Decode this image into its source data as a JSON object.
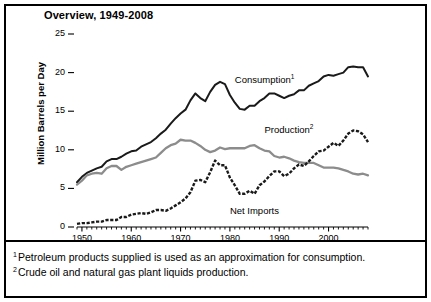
{
  "figure": {
    "title": "Overview, 1949-2008",
    "footnotes": [
      {
        "marker": "1",
        "text": "Petroleum products supplied is used as an approximation for consumption."
      },
      {
        "marker": "2",
        "text": "Crude oil and natural gas plant liquids production."
      }
    ]
  },
  "chart_data": {
    "type": "line",
    "title": "Overview, 1949-2008",
    "xlabel": "",
    "ylabel": "Million Barrels per Day",
    "xlim": [
      1949,
      2008
    ],
    "ylim": [
      0,
      25
    ],
    "yticks": [
      0,
      5,
      10,
      15,
      20,
      25
    ],
    "ytick_labels": [
      "0",
      "5",
      "10",
      "15",
      "20",
      "25"
    ],
    "xticks": [
      1950,
      1960,
      1970,
      1980,
      1990,
      2000
    ],
    "xtick_labels": [
      "1950",
      "1960",
      "1970",
      "1980",
      "1990",
      "2000"
    ],
    "minor_xticks_every": 1,
    "grid": false,
    "legend": "inline-annotations",
    "colors": {
      "consumption": "#1a1a1a",
      "production": "#8c8c8c",
      "net_imports": "#1a1a1a"
    },
    "x": [
      1949,
      1950,
      1951,
      1952,
      1953,
      1954,
      1955,
      1956,
      1957,
      1958,
      1959,
      1960,
      1961,
      1962,
      1963,
      1964,
      1965,
      1966,
      1967,
      1968,
      1969,
      1970,
      1971,
      1972,
      1973,
      1974,
      1975,
      1976,
      1977,
      1978,
      1979,
      1980,
      1981,
      1982,
      1983,
      1984,
      1985,
      1986,
      1987,
      1988,
      1989,
      1990,
      1991,
      1992,
      1993,
      1994,
      1995,
      1996,
      1997,
      1998,
      1999,
      2000,
      2001,
      2002,
      2003,
      2004,
      2005,
      2006,
      2007,
      2008
    ],
    "series": [
      {
        "name": "Consumption",
        "label": "Consumption",
        "footnote_marker": "1",
        "style": "solid-black",
        "label_position": {
          "x": 1981,
          "y": 19.1
        },
        "values": [
          5.8,
          6.5,
          7.0,
          7.3,
          7.6,
          7.8,
          8.5,
          8.8,
          8.8,
          9.1,
          9.5,
          9.8,
          9.9,
          10.4,
          10.7,
          11.0,
          11.5,
          12.1,
          12.6,
          13.4,
          14.1,
          14.7,
          15.2,
          16.4,
          17.3,
          16.7,
          16.3,
          17.5,
          18.4,
          18.8,
          18.5,
          17.1,
          16.1,
          15.3,
          15.2,
          15.7,
          15.7,
          16.3,
          16.7,
          17.3,
          17.3,
          17.0,
          16.7,
          17.0,
          17.2,
          17.7,
          17.7,
          18.3,
          18.6,
          18.9,
          19.5,
          19.7,
          19.6,
          19.8,
          20.0,
          20.7,
          20.8,
          20.7,
          20.7,
          19.5
        ]
      },
      {
        "name": "Production",
        "label": "Production",
        "footnote_marker": "2",
        "style": "solid-gray",
        "label_position": {
          "x": 1987,
          "y": 12.6
        },
        "values": [
          5.5,
          6.0,
          6.7,
          6.9,
          7.0,
          6.9,
          7.6,
          7.9,
          7.9,
          7.4,
          7.8,
          8.0,
          8.2,
          8.4,
          8.6,
          8.8,
          9.0,
          9.6,
          10.2,
          10.6,
          10.8,
          11.3,
          11.2,
          11.2,
          10.9,
          10.5,
          10.0,
          9.7,
          9.9,
          10.3,
          10.1,
          10.2,
          10.2,
          10.2,
          10.2,
          10.5,
          10.6,
          10.2,
          9.9,
          9.8,
          9.2,
          9.0,
          9.1,
          8.9,
          8.6,
          8.4,
          8.3,
          8.3,
          8.3,
          8.0,
          7.7,
          7.7,
          7.7,
          7.6,
          7.4,
          7.2,
          6.9,
          6.8,
          6.9,
          6.7
        ]
      },
      {
        "name": "Net Imports",
        "label": "Net Imports",
        "footnote_marker": "",
        "style": "dashed-black",
        "label_position": {
          "x": 1980,
          "y": 2.1
        },
        "values": [
          0.4,
          0.5,
          0.5,
          0.6,
          0.7,
          0.7,
          0.9,
          0.9,
          0.9,
          1.3,
          1.3,
          1.6,
          1.7,
          1.8,
          1.7,
          1.9,
          2.2,
          2.2,
          2.1,
          2.4,
          2.8,
          3.2,
          3.7,
          4.5,
          6.0,
          6.1,
          5.8,
          7.1,
          8.6,
          8.0,
          8.0,
          6.4,
          5.4,
          4.3,
          4.3,
          4.7,
          4.3,
          5.4,
          5.9,
          6.6,
          7.2,
          7.2,
          6.6,
          6.9,
          7.6,
          8.1,
          7.9,
          8.5,
          9.2,
          9.8,
          9.9,
          10.4,
          10.9,
          10.5,
          11.2,
          12.1,
          12.5,
          12.4,
          12.0,
          11.0
        ]
      }
    ]
  },
  "axis_geometry": {
    "plot_left_px": 77,
    "plot_right_px": 368,
    "y_zero_px": 227,
    "y_top_px": 34,
    "y_top_value": 25
  }
}
